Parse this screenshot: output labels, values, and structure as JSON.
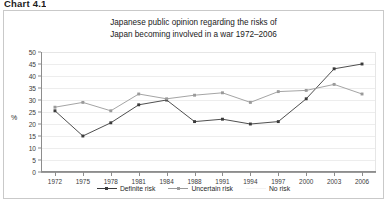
{
  "header": {
    "chart_label": "Chart 4.1"
  },
  "axis": {
    "y_title": "%",
    "y_ticks": [
      "0",
      "5",
      "10",
      "15",
      "20",
      "25",
      "30",
      "35",
      "40",
      "45",
      "50"
    ]
  },
  "legend": {
    "items": [
      {
        "label": "Definite risk",
        "color": "#3b3b3b",
        "marker": "diamond-marker",
        "style": "solid"
      },
      {
        "label": "Uncertain risk",
        "color": "#9a9a9a",
        "marker": "square-marker",
        "style": "solid"
      },
      {
        "label": "No risk",
        "color": "#f2f2f2",
        "marker": "none",
        "style": "solid"
      }
    ]
  },
  "chart_data": {
    "type": "line",
    "title": "Japanese public opinion regarding the risks of Japan becoming involved in a war 1972–2006",
    "title_lines": [
      "Japanese public opinion regarding the risks of",
      "Japan becoming involved in a war 1972–2006"
    ],
    "xlabel": "",
    "ylabel": "%",
    "ylim": [
      0,
      50
    ],
    "ytick_step": 5,
    "grid": true,
    "legend_position": "bottom",
    "categories": [
      "1972",
      "1975",
      "1978",
      "1981",
      "1984",
      "1988",
      "1991",
      "1994",
      "1997",
      "2000",
      "2003",
      "2006"
    ],
    "series": [
      {
        "name": "Definite risk",
        "color": "#3b3b3b",
        "values": [
          25.5,
          15.0,
          20.5,
          28.0,
          30.0,
          21.0,
          22.0,
          20.0,
          21.0,
          30.5,
          43.0,
          45.0
        ]
      },
      {
        "name": "Uncertain risk",
        "color": "#9a9a9a",
        "values": [
          27.0,
          29.0,
          25.5,
          32.5,
          30.5,
          32.0,
          33.0,
          29.0,
          33.5,
          34.0,
          36.5,
          32.5
        ]
      },
      {
        "name": "No risk",
        "color": "#f2f2f2",
        "values": [
          null,
          null,
          null,
          null,
          null,
          null,
          null,
          null,
          null,
          null,
          null,
          null
        ]
      }
    ]
  }
}
